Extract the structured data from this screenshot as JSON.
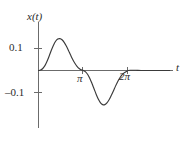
{
  "figure": {
    "kind": "line-plot",
    "background": "#ffffff",
    "ink_color": "#2b2b2b",
    "curve_color": "#3a3a3a",
    "axis_color": "#6b6b6b"
  },
  "axes": {
    "y_axis_label": "x(t)",
    "x_axis_label": "t",
    "y_ticks": [
      {
        "label": "0.1",
        "value": 0.1
      },
      {
        "label": "–0.1",
        "value": -0.1
      }
    ],
    "x_ticks": [
      {
        "label": "π",
        "value": 3.14159
      },
      {
        "label": "2π",
        "value": 6.28319
      }
    ]
  },
  "chart_data": {
    "type": "line",
    "title": "",
    "xlabel": "t",
    "ylabel": "x(t)",
    "xlim": [
      -0.35,
      9.2
    ],
    "ylim": [
      -0.22,
      0.215
    ],
    "grid": false,
    "legend": null,
    "x_tick_labels": [
      "π",
      "2π"
    ],
    "x_tick_values": [
      3.14159,
      6.28319
    ],
    "y_tick_labels": [
      "0.1",
      "–0.1"
    ],
    "y_tick_values": [
      0.1,
      -0.1
    ],
    "annotations": [
      {
        "text": "positive peak",
        "x": 1.5,
        "y": 0.145
      },
      {
        "text": "zero crossing",
        "x": 3.14159,
        "y": 0.0
      },
      {
        "text": "negative trough",
        "x": 4.75,
        "y": -0.155
      }
    ],
    "series": [
      {
        "name": "x(t)",
        "x": [
          0.0,
          0.15,
          0.3,
          0.45,
          0.6,
          0.75,
          0.9,
          1.05,
          1.2,
          1.35,
          1.5,
          1.65,
          1.8,
          1.95,
          2.1,
          2.25,
          2.4,
          2.55,
          2.7,
          2.85,
          3.0,
          3.14159,
          3.3,
          3.45,
          3.6,
          3.75,
          3.9,
          4.05,
          4.2,
          4.35,
          4.5,
          4.65,
          4.8,
          4.95,
          5.1,
          5.25,
          5.4,
          5.55,
          5.7,
          5.85,
          6.0,
          6.15,
          6.28319,
          6.5,
          6.8,
          7.2,
          7.7,
          8.2,
          8.7,
          9.2
        ],
        "y": [
          0.0,
          0.002,
          0.009,
          0.022,
          0.042,
          0.066,
          0.092,
          0.115,
          0.133,
          0.143,
          0.145,
          0.14,
          0.128,
          0.111,
          0.091,
          0.07,
          0.05,
          0.033,
          0.019,
          0.009,
          0.003,
          0.0,
          -0.006,
          -0.018,
          -0.036,
          -0.059,
          -0.084,
          -0.109,
          -0.131,
          -0.147,
          -0.155,
          -0.155,
          -0.147,
          -0.133,
          -0.114,
          -0.093,
          -0.071,
          -0.051,
          -0.034,
          -0.02,
          -0.011,
          -0.005,
          0.0,
          0.001,
          0.001,
          0.0,
          0.0,
          0.0,
          0.0,
          0.0
        ]
      }
    ]
  }
}
